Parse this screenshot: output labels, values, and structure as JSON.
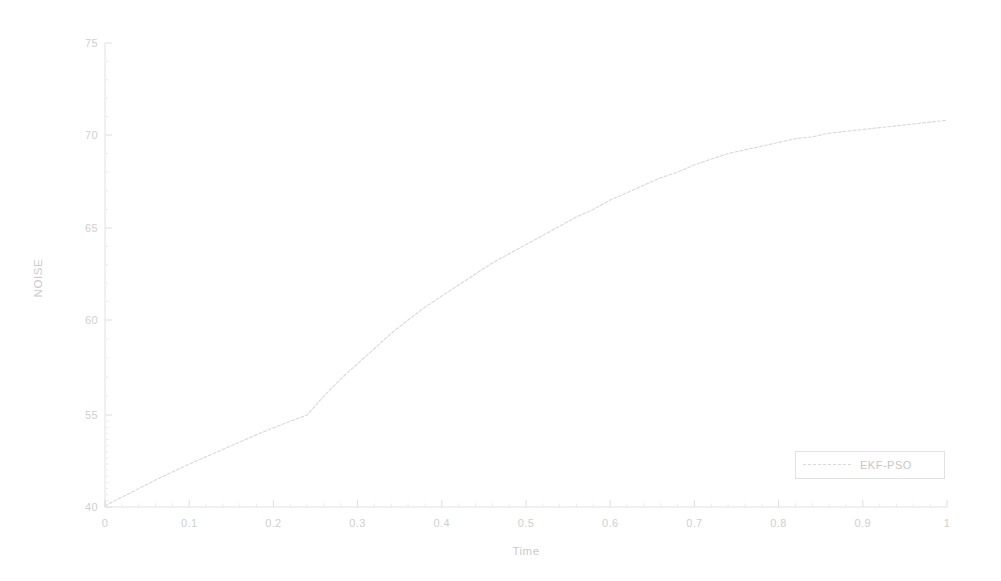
{
  "figure": {
    "background": "#ffffff",
    "line_color": "#d8d8d8",
    "axis_color": "#e0e0e0",
    "text_color": "#cbcbcb"
  },
  "axes": {
    "ylabel": "NOISE",
    "xlabel": "Time",
    "ytick_labels": [
      "75",
      "70",
      "65",
      "60",
      "55",
      "40"
    ],
    "xtick_labels": [
      "0",
      "0.1",
      "0.2",
      "0.3",
      "0.4",
      "0.5",
      "0.6",
      "0.7",
      "0.8",
      "0.9",
      "1"
    ]
  },
  "legend": {
    "position": "lower right",
    "entries": [
      {
        "label": "EKF-PSO",
        "style": "dashed",
        "color": "#dadada"
      }
    ]
  },
  "chart_data": {
    "type": "line",
    "title": "",
    "xlabel": "Time",
    "ylabel": "NOISE",
    "xlim": [
      0,
      1
    ],
    "ylim": [
      40,
      75
    ],
    "xticks": [
      0,
      0.1,
      0.2,
      0.3,
      0.4,
      0.5,
      0.6,
      0.7,
      0.8,
      0.9,
      1
    ],
    "yticks": [
      40,
      55,
      60,
      65,
      70,
      75
    ],
    "grid": false,
    "legend_position": "lower right",
    "series": [
      {
        "name": "EKF-PSO",
        "color": "#d8d8d8",
        "style": "dashed",
        "x": [
          0.0,
          0.02,
          0.04,
          0.06,
          0.08,
          0.1,
          0.12,
          0.14,
          0.16,
          0.18,
          0.2,
          0.22,
          0.24,
          0.26,
          0.28,
          0.3,
          0.32,
          0.34,
          0.36,
          0.38,
          0.4,
          0.42,
          0.44,
          0.46,
          0.48,
          0.5,
          0.52,
          0.54,
          0.56,
          0.58,
          0.6,
          0.62,
          0.64,
          0.66,
          0.68,
          0.7,
          0.72,
          0.74,
          0.76,
          0.78,
          0.8,
          0.82,
          0.84,
          0.86,
          0.88,
          0.9,
          0.92,
          0.94,
          0.96,
          0.98,
          1.0
        ],
        "y": [
          40.2,
          41.6,
          43.0,
          44.4,
          45.7,
          47.0,
          48.2,
          49.4,
          50.6,
          51.8,
          52.9,
          54.0,
          55.0,
          56.0,
          56.9,
          57.7,
          58.5,
          59.3,
          60.0,
          60.7,
          61.3,
          61.9,
          62.5,
          63.1,
          63.6,
          64.1,
          64.6,
          65.1,
          65.6,
          66.0,
          66.5,
          66.9,
          67.3,
          67.7,
          68.0,
          68.4,
          68.7,
          69.0,
          69.2,
          69.4,
          69.6,
          69.8,
          69.9,
          70.1,
          70.2,
          70.3,
          70.4,
          70.5,
          70.6,
          70.7,
          70.8
        ]
      }
    ]
  }
}
